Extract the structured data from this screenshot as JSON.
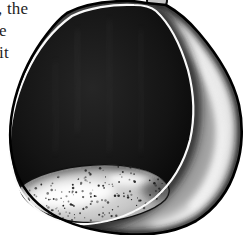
{
  "page": {
    "background": "#ffffff"
  },
  "text_column": {
    "lines": [
      {
        "text": ", the"
      },
      {
        "text": "e"
      },
      {
        "text": "it"
      }
    ]
  },
  "illustration": {
    "name": "hollowed-egg-shell-drawing",
    "description": "Pen-and-ink drawing of an egg-shaped hollow shell cut open: dark cross-hatched interior cavity, speckled light floor at the bottom, glossy shaded outer shell wrapping around the right side, and a small stem knob at the top",
    "palette": {
      "ink": "#000000",
      "paper": "#ffffff",
      "shell_base": "#9e9e9e",
      "shell_highlight": "#f5f5f5",
      "shell_shadow": "#151515",
      "cavity_center": "#262626",
      "cavity_mid": "#141414",
      "cavity_edge": "#000000",
      "floor_light": "#efefef",
      "floor_mid": "#c7c7c7",
      "floor_dark": "#878787",
      "knob_fill": "#c4c4c4"
    },
    "speckles": {
      "count": 155,
      "seed": 9,
      "color": "#141414"
    }
  }
}
